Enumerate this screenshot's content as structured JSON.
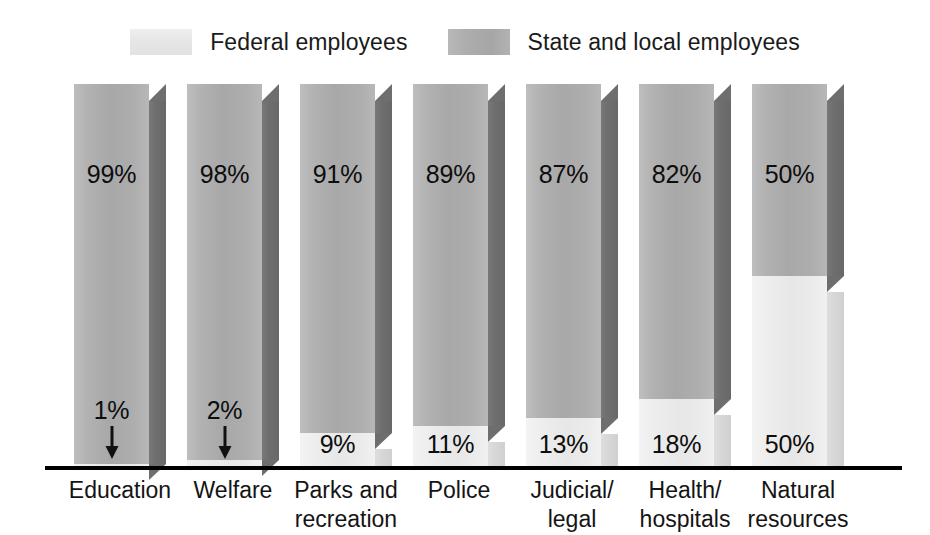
{
  "legend": {
    "position": "top-center",
    "entries": [
      {
        "label": "Federal employees",
        "swatch_name": "federal-swatch",
        "color": "#e8e8e8"
      },
      {
        "label": "State and local employees",
        "swatch_name": "state-local-swatch",
        "color": "#aeaeae"
      }
    ]
  },
  "axis": {
    "baseline_name": "x-axis-baseline",
    "categories": [
      {
        "line1": "Education",
        "line2": ""
      },
      {
        "line1": "Welfare",
        "line2": ""
      },
      {
        "line1": "Parks and",
        "line2": "recreation"
      },
      {
        "line1": "Police",
        "line2": ""
      },
      {
        "line1": "Judicial/",
        "line2": "legal"
      },
      {
        "line1": "Health/",
        "line2": "hospitals"
      },
      {
        "line1": "Natural",
        "line2": "resources"
      }
    ]
  },
  "chart_data": {
    "type": "bar",
    "subtype": "100% stacked column, 3D",
    "title": "",
    "subtitle": "",
    "xlabel": "",
    "ylabel": "",
    "ylim": [
      0,
      100
    ],
    "grid": false,
    "legend_position": "top-center",
    "categories": [
      "Education",
      "Welfare",
      "Parks and recreation",
      "Police",
      "Judicial/legal",
      "Health/hospitals",
      "Natural resources"
    ],
    "series": [
      {
        "name": "State and local employees",
        "color": "#aeaeae",
        "values": [
          99,
          98,
          91,
          89,
          87,
          82,
          50
        ],
        "labels": [
          "99%",
          "98%",
          "91%",
          "89%",
          "87%",
          "82%",
          "50%"
        ]
      },
      {
        "name": "Federal employees",
        "color": "#e8e8e8",
        "values": [
          1,
          2,
          9,
          11,
          13,
          18,
          50
        ],
        "labels": [
          "1%",
          "2%",
          "9%",
          "11%",
          "13%",
          "18%",
          "50%"
        ]
      }
    ],
    "annotations": [
      {
        "category": "Education",
        "text": "1%",
        "marker": "down-arrow",
        "points_to": "federal segment"
      },
      {
        "category": "Welfare",
        "text": "2%",
        "marker": "down-arrow",
        "points_to": "federal segment"
      }
    ]
  },
  "bars": [
    {
      "name": "bar-education",
      "state_label": "99%",
      "federal_label": "1%",
      "state_pct": 99,
      "federal_pct": 1,
      "arrow": true
    },
    {
      "name": "bar-welfare",
      "state_label": "98%",
      "federal_label": "2%",
      "state_pct": 98,
      "federal_pct": 2,
      "arrow": true
    },
    {
      "name": "bar-parks-and-recreation",
      "state_label": "91%",
      "federal_label": "9%",
      "state_pct": 91,
      "federal_pct": 9,
      "arrow": false
    },
    {
      "name": "bar-police",
      "state_label": "89%",
      "federal_label": "11%",
      "state_pct": 89,
      "federal_pct": 11,
      "arrow": false
    },
    {
      "name": "bar-judicial-legal",
      "state_label": "87%",
      "federal_label": "13%",
      "state_pct": 87,
      "federal_pct": 13,
      "arrow": false
    },
    {
      "name": "bar-health-hospitals",
      "state_label": "82%",
      "federal_label": "18%",
      "state_pct": 82,
      "federal_pct": 18,
      "arrow": false
    },
    {
      "name": "bar-natural-resources",
      "state_label": "50%",
      "federal_label": "50%",
      "state_pct": 50,
      "federal_pct": 50,
      "arrow": false
    }
  ]
}
